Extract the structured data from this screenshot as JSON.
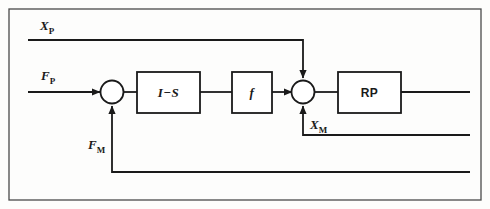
{
  "figure": {
    "type": "control-system-block-diagram",
    "border_color": "#4a4a4a",
    "line_color": "#1a1a1a",
    "background": "#fdfdfc"
  },
  "signals": {
    "reference_position": {
      "label": "X",
      "subscript": "P",
      "name": "X_P"
    },
    "reference_force": {
      "label": "F",
      "subscript": "P",
      "name": "F_P"
    },
    "measured_force": {
      "label": "F",
      "subscript": "M",
      "name": "F_M"
    },
    "measured_position": {
      "label": "X",
      "subscript": "M",
      "name": "X_M"
    }
  },
  "blocks": [
    {
      "id": "compliance",
      "label": "I−S",
      "style": "italic"
    },
    {
      "id": "function",
      "label": "f",
      "style": "italic"
    },
    {
      "id": "robot-plant",
      "label": "RP",
      "style": "upright"
    }
  ],
  "junctions": [
    {
      "id": "summing-junction-1",
      "inputs": [
        "F_P",
        "F_M"
      ]
    },
    {
      "id": "summing-junction-2",
      "inputs": [
        "f-output",
        "X_P",
        "X_M"
      ]
    }
  ]
}
